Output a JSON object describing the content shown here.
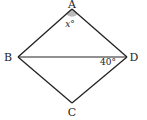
{
  "diagram": {
    "type": "quadrilateral",
    "vertices": {
      "A": {
        "label": "A"
      },
      "B": {
        "label": "B"
      },
      "C": {
        "label": "C"
      },
      "D": {
        "label": "D"
      }
    },
    "angles": {
      "at_A": "x°",
      "at_D": "40°"
    },
    "segments": [
      "AB",
      "AD",
      "BC",
      "CD",
      "BD"
    ],
    "colors": {
      "line": "#222222",
      "angle_fill": "#bbbbbb"
    }
  }
}
